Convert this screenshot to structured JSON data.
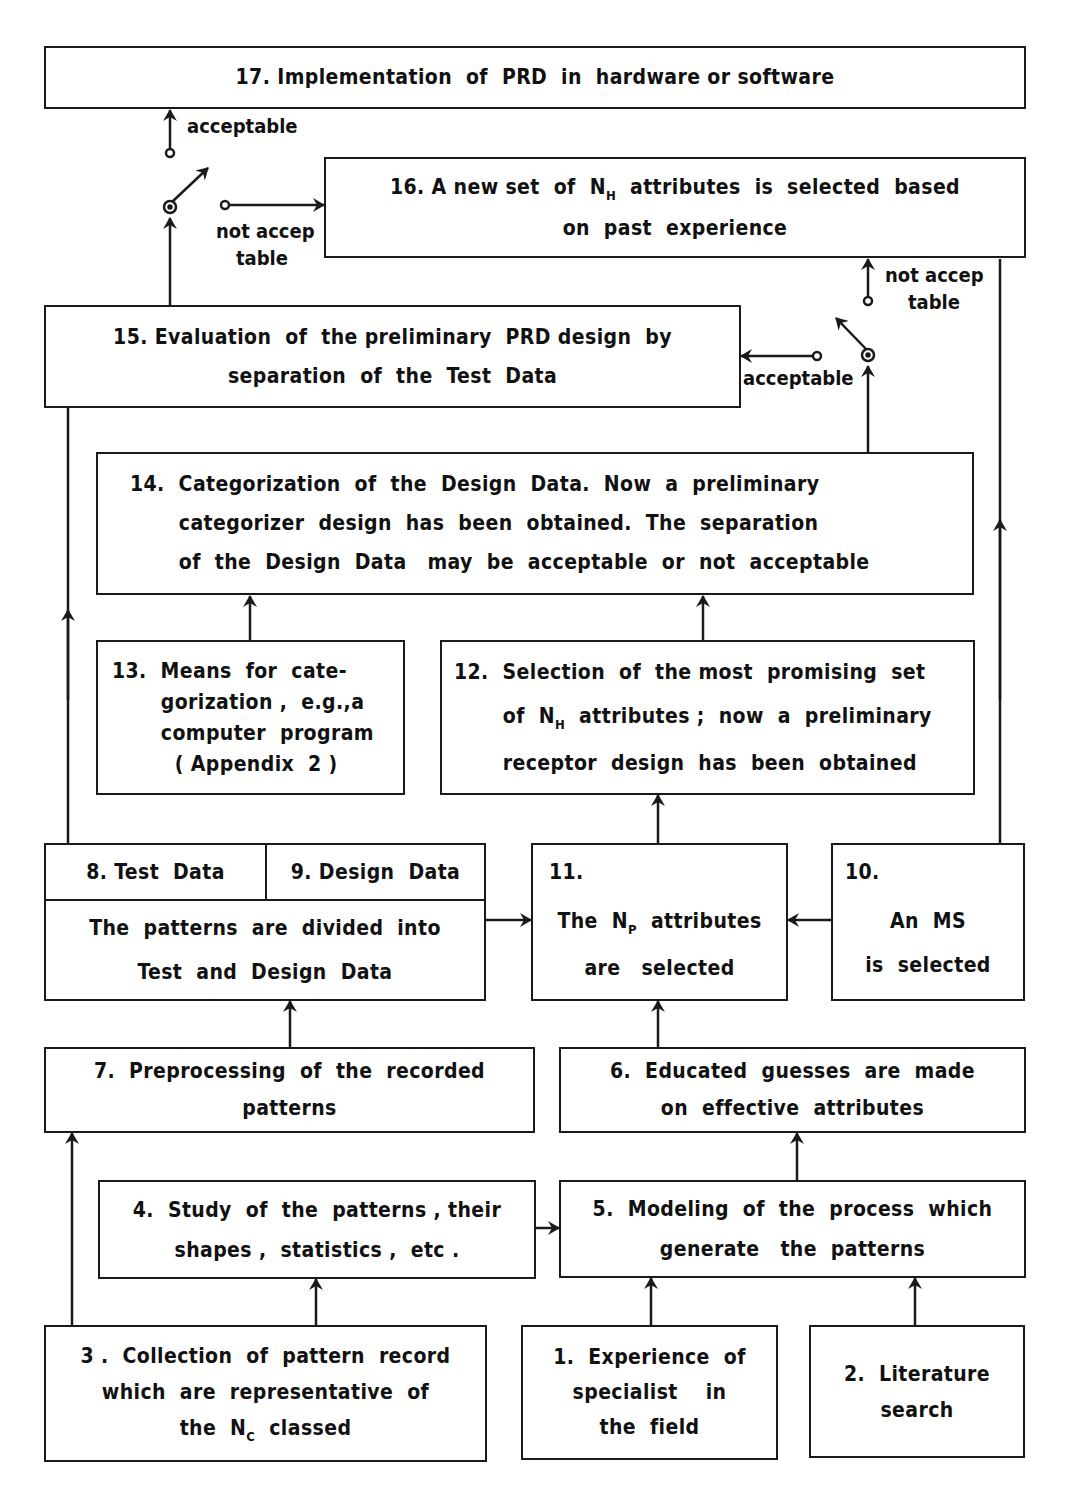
{
  "diagram": {
    "type": "flowchart",
    "boxes": {
      "b17": {
        "id": "17",
        "lines": [
          "17. Implementation  of  PRD  in  hardware or software"
        ]
      },
      "b16": {
        "id": "16",
        "line1_pre": "16. A new set  of  N",
        "line1_sub": "H",
        "line1_post": "  attributes  is  selected  based",
        "line2": "on  past  experience"
      },
      "b15": {
        "id": "15",
        "line1": "15. Evaluation  of  the preliminary  PRD design  by",
        "line2": "separation  of  the  Test  Data"
      },
      "b14": {
        "id": "14",
        "line1": "14.  Categorization  of  the  Design  Data.  Now  a  preliminary",
        "line2": "       categorizer  design  has  been  obtained.  The  separation",
        "line3": "       of  the  Design  Data   may  be  acceptable  or  not  acceptable"
      },
      "b13": {
        "id": "13",
        "line1": "13.  Means  for  cate-",
        "line2": "       gorization ,  e.g.,a",
        "line3": "       computer  program",
        "line4": "         ( Appendix  2 )"
      },
      "b12": {
        "id": "12",
        "line1": "12.  Selection  of  the most  promising  set",
        "line2_pre": "       of  N",
        "line2_sub": "H",
        "line2_post": "  attributes ;  now  a  preliminary",
        "line3": "       receptor  design  has  been  obtained"
      },
      "b8": {
        "id": "8",
        "label": "8. Test  Data"
      },
      "b9": {
        "id": "9",
        "label": "9. Design  Data"
      },
      "b89_body": {
        "line1": "The  patterns  are  divided  into",
        "line2": "Test  and  Design  Data"
      },
      "b11": {
        "id": "11",
        "num": "11.",
        "line1_pre": "The  N",
        "line1_sub": "P",
        "line1_post": "  attributes",
        "line2": "are   selected"
      },
      "b10": {
        "id": "10",
        "num": "10.",
        "line1": "An  MS",
        "line2": "is  selected"
      },
      "b7": {
        "id": "7",
        "line1": "7.  Preprocessing  of  the  recorded",
        "line2": "patterns"
      },
      "b6": {
        "id": "6",
        "line1": "6.  Educated  guesses  are  made",
        "line2": "on  effective  attributes"
      },
      "b4": {
        "id": "4",
        "line1": "4.  Study  of  the  patterns , their",
        "line2": "shapes ,  statistics ,  etc ."
      },
      "b5": {
        "id": "5",
        "line1": "5.  Modeling  of  the  process  which",
        "line2": "generate   the  patterns"
      },
      "b3": {
        "id": "3",
        "line1": "3 .  Collection  of  pattern  record",
        "line2": "which  are  representative  of",
        "line3_pre": "the  N",
        "line3_sub": "C",
        "line3_post": "  classed"
      },
      "b1": {
        "id": "1",
        "line1": "1.  Experience  of",
        "line2": "specialist    in",
        "line3": "the  field"
      },
      "b2": {
        "id": "2",
        "line1": "2.  Literature",
        "line2": "search"
      }
    },
    "switch_labels": {
      "top_acceptable": "acceptable",
      "top_not_acceptable_1": "not accep",
      "top_not_acceptable_2": "table",
      "right_not_acceptable_1": "not accep",
      "right_not_acceptable_2": "table",
      "right_acceptable": "acceptable"
    },
    "edges": [
      {
        "from": "1",
        "to": "5"
      },
      {
        "from": "2",
        "to": "5"
      },
      {
        "from": "3",
        "to": "4"
      },
      {
        "from": "3",
        "to": "7"
      },
      {
        "from": "4",
        "to": "5"
      },
      {
        "from": "5",
        "to": "6"
      },
      {
        "from": "6",
        "to": "11"
      },
      {
        "from": "7",
        "to": "8/9"
      },
      {
        "from": "8/9",
        "to": "11"
      },
      {
        "from": "10",
        "to": "11"
      },
      {
        "from": "10",
        "to": "16"
      },
      {
        "from": "11",
        "to": "12"
      },
      {
        "from": "12",
        "to": "14"
      },
      {
        "from": "13",
        "to": "14"
      },
      {
        "from": "8",
        "to": "15"
      },
      {
        "from": "14",
        "to": "switch-right"
      },
      {
        "from": "switch-right",
        "to": "15",
        "label": "acceptable"
      },
      {
        "from": "switch-right",
        "to": "16",
        "label": "not acceptable"
      },
      {
        "from": "15",
        "to": "switch-top"
      },
      {
        "from": "switch-top",
        "to": "17",
        "label": "acceptable"
      },
      {
        "from": "switch-top",
        "to": "16",
        "label": "not acceptable"
      }
    ]
  }
}
